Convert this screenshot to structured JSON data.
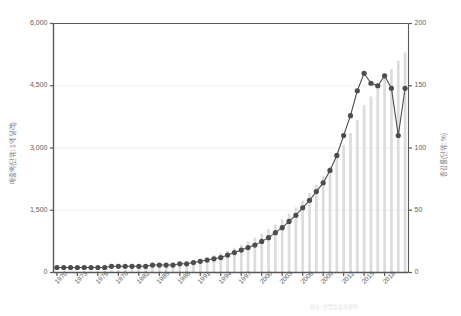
{
  "chart_data": {
    "type": "bar",
    "title": "",
    "subtitle": "",
    "xlabel": "",
    "ylabel": "매출액(단위: 1억 달러)",
    "ylabel_right": "증감률(단위: %)",
    "ylim": [
      0,
      6000
    ],
    "ylim_right": [
      0,
      200
    ],
    "yticks": [
      "0",
      "1,500",
      "3,000",
      "4,500",
      "6,000"
    ],
    "ytick_values": [
      0,
      1500,
      3000,
      4500,
      6000
    ],
    "yticks_right": [
      "0",
      "50",
      "100",
      "150",
      "200"
    ],
    "ytick_values_right": [
      0,
      50,
      100,
      150,
      200
    ],
    "grid": true,
    "legend": "none",
    "x": [
      1970,
      1971,
      1972,
      1973,
      1974,
      1975,
      1976,
      1977,
      1978,
      1979,
      1980,
      1981,
      1982,
      1983,
      1984,
      1985,
      1986,
      1987,
      1988,
      1989,
      1990,
      1991,
      1992,
      1993,
      1994,
      1995,
      1996,
      1997,
      1998,
      1999,
      2000,
      2001,
      2002,
      2003,
      2004,
      2005,
      2006,
      2007,
      2008,
      2009,
      2010,
      2011,
      2012,
      2013,
      2014,
      2015,
      2016,
      2017,
      2018,
      2019,
      2020,
      2021
    ],
    "categories": [
      "1970",
      "1971",
      "1972",
      "1973",
      "1974",
      "1975",
      "1976",
      "1977",
      "1978",
      "1979",
      "1980",
      "1981",
      "1982",
      "1983",
      "1984",
      "1985",
      "1986",
      "1987",
      "1988",
      "1989",
      "1990",
      "1991",
      "1992",
      "1993",
      "1994",
      "1995",
      "1996",
      "1997",
      "1998",
      "1999",
      "2000",
      "2001",
      "2002",
      "2003",
      "2004",
      "2005",
      "2006",
      "2007",
      "2008",
      "2009",
      "2010",
      "2011",
      "2012",
      "2013",
      "2014",
      "2015",
      "2016",
      "2017",
      "2018",
      "2019",
      "2020",
      "2021"
    ],
    "xtick_labels": [
      "1970",
      "1973",
      "1976",
      "1979",
      "1982",
      "1985",
      "1988",
      "1991",
      "1994",
      "1997",
      "2000",
      "2003",
      "2006",
      "2009",
      "2012",
      "2015",
      "2018"
    ],
    "xtick_years": [
      1970,
      1973,
      1976,
      1979,
      1982,
      1985,
      1988,
      1991,
      1994,
      1997,
      2000,
      2003,
      2006,
      2009,
      2012,
      2015,
      2018
    ],
    "series": [
      {
        "name": "매출액",
        "type": "bar",
        "axis": "left",
        "color": "#dcdcdc",
        "values": [
          10,
          12,
          14,
          18,
          22,
          26,
          32,
          40,
          50,
          62,
          74,
          88,
          100,
          115,
          132,
          150,
          172,
          198,
          228,
          258,
          292,
          330,
          372,
          418,
          470,
          530,
          596,
          670,
          750,
          840,
          940,
          1045,
          1160,
          1285,
          1420,
          1570,
          1735,
          1915,
          2110,
          2320,
          2550,
          2800,
          3070,
          3360,
          3680,
          4030,
          4240,
          4480,
          4700,
          4900,
          5100,
          5300
        ]
      },
      {
        "name": "증감률",
        "type": "line",
        "axis": "right",
        "color": "#4d4d4d",
        "values": [
          4,
          4,
          4,
          4,
          4,
          4,
          4,
          4,
          5,
          5,
          5,
          5,
          5,
          5,
          6,
          6,
          6,
          6,
          7,
          7,
          8,
          9,
          10,
          11,
          12,
          14,
          16,
          18,
          20,
          22,
          25,
          28,
          32,
          36,
          41,
          46,
          52,
          58,
          65,
          72,
          82,
          94,
          110,
          126,
          146,
          160,
          152,
          150,
          158,
          148,
          110,
          148
        ],
        "marker": "circle"
      }
    ],
    "line_points_right_axis": [
      {
        "year": 1970,
        "value": 4
      },
      {
        "year": 1971,
        "value": 4
      },
      {
        "year": 1972,
        "value": 4
      },
      {
        "year": 1973,
        "value": 4
      },
      {
        "year": 1974,
        "value": 4
      },
      {
        "year": 1975,
        "value": 4
      },
      {
        "year": 1976,
        "value": 4
      },
      {
        "year": 1977,
        "value": 4
      },
      {
        "year": 1978,
        "value": 5
      },
      {
        "year": 1979,
        "value": 5
      },
      {
        "year": 1980,
        "value": 5
      },
      {
        "year": 1981,
        "value": 5
      },
      {
        "year": 1982,
        "value": 5
      },
      {
        "year": 1983,
        "value": 5
      },
      {
        "year": 1984,
        "value": 6
      },
      {
        "year": 1985,
        "value": 6
      },
      {
        "year": 1986,
        "value": 6
      },
      {
        "year": 1987,
        "value": 6
      },
      {
        "year": 1988,
        "value": 7
      },
      {
        "year": 1989,
        "value": 7
      },
      {
        "year": 1990,
        "value": 8
      },
      {
        "year": 1991,
        "value": 9
      },
      {
        "year": 1992,
        "value": 10
      },
      {
        "year": 1993,
        "value": 11
      },
      {
        "year": 1994,
        "value": 12
      },
      {
        "year": 1995,
        "value": 14
      },
      {
        "year": 1996,
        "value": 16
      },
      {
        "year": 1997,
        "value": 18
      },
      {
        "year": 1998,
        "value": 20
      },
      {
        "year": 1999,
        "value": 22
      },
      {
        "year": 2000,
        "value": 25
      },
      {
        "year": 2001,
        "value": 28
      },
      {
        "year": 2002,
        "value": 32
      },
      {
        "year": 2003,
        "value": 36
      },
      {
        "year": 2004,
        "value": 41
      },
      {
        "year": 2005,
        "value": 46
      },
      {
        "year": 2006,
        "value": 52
      },
      {
        "year": 2007,
        "value": 58
      },
      {
        "year": 2008,
        "value": 65
      },
      {
        "year": 2009,
        "value": 72
      },
      {
        "year": 2010,
        "value": 82
      },
      {
        "year": 2011,
        "value": 94
      },
      {
        "year": 2012,
        "value": 110
      },
      {
        "year": 2013,
        "value": 126
      },
      {
        "year": 2014,
        "value": 146
      },
      {
        "year": 2015,
        "value": 160
      },
      {
        "year": 2016,
        "value": 152
      },
      {
        "year": 2017,
        "value": 150
      },
      {
        "year": 2018,
        "value": 158
      },
      {
        "year": 2019,
        "value": 148
      },
      {
        "year": 2020,
        "value": 110
      },
      {
        "year": 2021,
        "value": 148
      }
    ]
  },
  "footer": {
    "source_note": "자료: 산업통상자원부"
  }
}
